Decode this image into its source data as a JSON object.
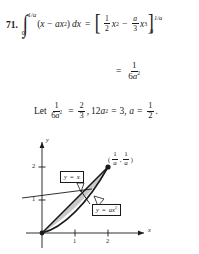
{
  "problem": {
    "number": "71.",
    "line1": {
      "integral_lower": "0",
      "integral_upper": "1/a",
      "integrand_open": "(",
      "integrand_x": "x",
      "integrand_minus": "−",
      "integrand_a": "a",
      "integrand_xsq_base": "x",
      "integrand_xsq_exp": "2",
      "integrand_close": ")",
      "differential": "dx",
      "equals": "=",
      "bracket_open": "[",
      "bracket_close": "]",
      "term1_frac_top": "1",
      "term1_frac_bot": "2",
      "term1_var": "x",
      "term1_exp": "2",
      "mid_minus": "−",
      "term2_frac_top": "a",
      "term2_frac_bot": "3",
      "term2_var": "x",
      "term2_exp": "3",
      "eval_upper": "1/a",
      "eval_lower": "0"
    },
    "line2": {
      "equals": "=",
      "frac_top": "1",
      "frac_bot_num": "6",
      "frac_bot_var": "a",
      "frac_bot_exp": "2"
    },
    "line3": {
      "let": "Let",
      "lhs_top": "1",
      "lhs_bot_num": "6",
      "lhs_bot_var": "a",
      "lhs_bot_exp": "2",
      "eq1": "=",
      "rhs_top": "2",
      "rhs_bot": "3",
      "comma1": ",",
      "coef": "12",
      "coef_var": "a",
      "coef_exp": "2",
      "eq2": "=",
      "value": "3",
      "comma2": ",",
      "var_a": "a",
      "eq3": "=",
      "ans_top": "1",
      "ans_bot": "2",
      "period": "."
    }
  },
  "figure": {
    "x_axis_label": "x",
    "y_axis_label": "y",
    "x_ticks": [
      "1",
      "2"
    ],
    "y_ticks": [
      "1",
      "2"
    ],
    "callouts": [
      {
        "name": "line-label",
        "text_y": "y",
        "text_eq": "=",
        "text_rhs": "x"
      },
      {
        "name": "parabola-label",
        "text_y": "y",
        "text_eq": "=",
        "text_a": "a",
        "text_x": "x",
        "text_exp": "2"
      }
    ],
    "point_label": {
      "open": "(",
      "x_top": "1",
      "x_bot": "a",
      "comma": ",",
      "y_top": "1",
      "y_bot": "a",
      "close": ")"
    },
    "shaded_fill": "#c9c9c9",
    "stroke": "#1a1a1a"
  }
}
